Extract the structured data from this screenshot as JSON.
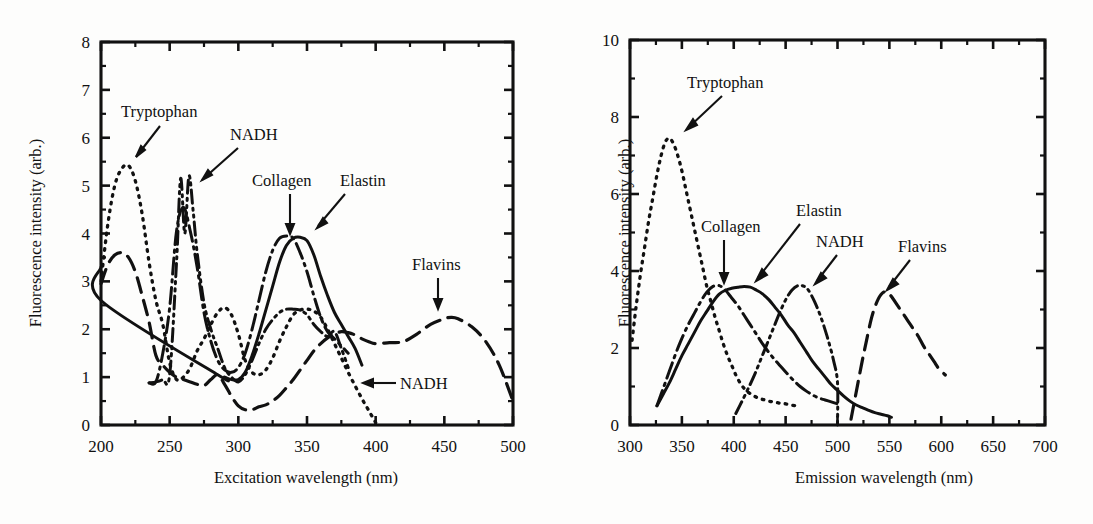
{
  "figure": {
    "kind": "two-panel-line-plot",
    "background": "#fdfdfc",
    "ink_color": "#111111"
  },
  "panels": {
    "left": {
      "ylabel": "Fluorescence intensity (arb.)",
      "xlabel": "Excitation wavelength (nm)",
      "xticks": [
        "200",
        "250",
        "300",
        "350",
        "400",
        "450",
        "500"
      ],
      "yticks": [
        "0",
        "1",
        "2",
        "3",
        "4",
        "5",
        "6",
        "7",
        "8"
      ],
      "annotations": [
        {
          "text": "Tryptophan"
        },
        {
          "text": "NADH"
        },
        {
          "text": "Collagen"
        },
        {
          "text": "Elastin"
        },
        {
          "text": "Flavins"
        },
        {
          "text": "NADH"
        }
      ]
    },
    "right": {
      "ylabel": "Fluorescence intensity (arb.)",
      "xlabel": "Emission wavelength (nm)",
      "xticks": [
        "300",
        "350",
        "400",
        "450",
        "500",
        "550",
        "600",
        "650",
        "700"
      ],
      "yticks": [
        "0",
        "2",
        "4",
        "6",
        "8",
        "10"
      ],
      "annotations": [
        {
          "text": "Tryptophan"
        },
        {
          "text": "Collagen"
        },
        {
          "text": "Elastin"
        },
        {
          "text": "NADH"
        },
        {
          "text": "Flavins"
        }
      ]
    }
  },
  "chart_data": [
    {
      "type": "line",
      "panel": "left",
      "title": "",
      "xlabel": "Excitation wavelength (nm)",
      "ylabel": "Fluorescence intensity (arb.)",
      "xlim": [
        200,
        500
      ],
      "ylim": [
        0,
        8
      ],
      "xticks": [
        200,
        250,
        300,
        350,
        400,
        450,
        500
      ],
      "yticks": [
        0,
        1,
        2,
        3,
        4,
        5,
        6,
        7,
        8
      ],
      "grid": false,
      "legend": "inline-annotations",
      "series": [
        {
          "name": "Tryptophan",
          "style": "dotted",
          "x": [
            200,
            205,
            210,
            215,
            220,
            225,
            230,
            235,
            240,
            245,
            250,
            255,
            260,
            265,
            270,
            275,
            280,
            285,
            290,
            295,
            300,
            305,
            310,
            315,
            320,
            325,
            330,
            335,
            340,
            345,
            350,
            355,
            360,
            365,
            370,
            375,
            380,
            385,
            390,
            395,
            400
          ],
          "y": [
            3.0,
            4.2,
            5.0,
            5.35,
            5.42,
            5.1,
            4.4,
            3.4,
            2.6,
            2.1,
            1.3,
            0.95,
            1.0,
            1.2,
            1.55,
            1.8,
            2.1,
            2.35,
            2.45,
            2.3,
            1.9,
            1.35,
            1.1,
            1.05,
            1.15,
            1.4,
            1.75,
            2.05,
            2.3,
            2.4,
            2.42,
            2.38,
            2.25,
            2.0,
            1.7,
            1.4,
            1.1,
            0.82,
            0.55,
            0.3,
            0.05
          ]
        },
        {
          "name": "NADH",
          "style": "dash-dot-dot",
          "x": [
            235,
            240,
            245,
            250,
            255,
            258,
            261,
            264,
            267,
            270,
            275,
            280,
            285,
            290,
            295,
            300,
            305,
            310,
            315,
            320,
            325,
            330,
            335,
            340,
            345,
            350,
            355,
            360,
            365,
            370,
            375,
            380
          ],
          "y": [
            0.88,
            0.9,
            0.95,
            1.05,
            3.4,
            5.15,
            4.0,
            5.2,
            4.5,
            3.6,
            2.55,
            2.0,
            1.6,
            1.2,
            1.0,
            0.9,
            1.05,
            1.35,
            1.7,
            2.0,
            2.2,
            2.35,
            2.42,
            2.42,
            2.4,
            2.3,
            2.1,
            1.95,
            1.85,
            1.95,
            1.6,
            1.2
          ]
        },
        {
          "name": "Collagen",
          "style": "dash-dot",
          "x": [
            235,
            240,
            245,
            250,
            255,
            260,
            265,
            270,
            275,
            280,
            285,
            290,
            295,
            300,
            305,
            310,
            315,
            320,
            325,
            330,
            335,
            340,
            345,
            350,
            355,
            360,
            365,
            370,
            375,
            380
          ],
          "y": [
            0.88,
            0.9,
            1.5,
            2.45,
            4.05,
            4.55,
            4.05,
            3.3,
            2.35,
            1.75,
            1.35,
            1.15,
            1.1,
            1.2,
            1.5,
            2.0,
            2.6,
            3.2,
            3.65,
            3.9,
            3.95,
            3.9,
            3.6,
            3.2,
            2.7,
            2.25,
            1.95,
            1.8,
            1.65,
            1.5
          ]
        },
        {
          "name": "Elastin",
          "style": "solid",
          "x": [
            200,
            200,
            285,
            290,
            295,
            300,
            305,
            310,
            315,
            320,
            325,
            330,
            335,
            340,
            345,
            350,
            355,
            360,
            365,
            370,
            375,
            380,
            385,
            390
          ],
          "y": [
            3.3,
            2.6,
            1.05,
            1.0,
            0.95,
            0.95,
            1.1,
            1.45,
            1.9,
            2.4,
            2.9,
            3.4,
            3.75,
            3.9,
            3.92,
            3.85,
            3.55,
            3.1,
            2.7,
            2.35,
            2.1,
            1.85,
            1.6,
            1.25
          ]
        },
        {
          "name": "Flavins",
          "style": "long-dash",
          "x": [
            200,
            205,
            210,
            215,
            220,
            225,
            230,
            235,
            240,
            245,
            250,
            255,
            260,
            265,
            270,
            275,
            280,
            285,
            290,
            295,
            300,
            305,
            310,
            315,
            320,
            325,
            330,
            335,
            340,
            345,
            350,
            355,
            360,
            365,
            370,
            375,
            380,
            385,
            390,
            395,
            400,
            410,
            420,
            430,
            440,
            450,
            455,
            460,
            470,
            480,
            490,
            500
          ],
          "y": [
            2.95,
            3.35,
            3.55,
            3.6,
            3.5,
            3.2,
            2.7,
            2.15,
            1.45,
            1.25,
            1.1,
            1.0,
            0.95,
            0.9,
            0.85,
            0.82,
            0.95,
            1.05,
            0.85,
            0.6,
            0.4,
            0.32,
            0.32,
            0.38,
            0.42,
            0.5,
            0.62,
            0.78,
            0.95,
            1.15,
            1.35,
            1.55,
            1.7,
            1.82,
            1.9,
            1.95,
            1.93,
            1.88,
            1.8,
            1.74,
            1.7,
            1.72,
            1.74,
            1.9,
            2.1,
            2.22,
            2.25,
            2.22,
            2.05,
            1.75,
            1.25,
            0.5
          ]
        }
      ]
    },
    {
      "type": "line",
      "panel": "right",
      "title": "",
      "xlabel": "Emission wavelength (nm)",
      "ylabel": "Fluorescence intensity (arb.)",
      "xlim": [
        300,
        700
      ],
      "ylim": [
        0,
        10
      ],
      "xticks": [
        300,
        350,
        400,
        450,
        500,
        550,
        600,
        650,
        700
      ],
      "yticks": [
        0,
        2,
        4,
        6,
        8,
        10
      ],
      "grid": false,
      "legend": "inline-annotations",
      "series": [
        {
          "name": "Tryptophan",
          "style": "dotted",
          "x": [
            302,
            306,
            310,
            314,
            318,
            322,
            326,
            330,
            334,
            338,
            342,
            346,
            350,
            354,
            358,
            362,
            366,
            370,
            374,
            378,
            382,
            386,
            390,
            394,
            398,
            402,
            406,
            410,
            414,
            418,
            422,
            426,
            430,
            434,
            438,
            442,
            446,
            450,
            455,
            460
          ],
          "y": [
            2.2,
            3.1,
            3.9,
            4.6,
            5.3,
            5.9,
            6.5,
            7.0,
            7.35,
            7.45,
            7.3,
            7.0,
            6.6,
            6.1,
            5.6,
            5.1,
            4.6,
            4.1,
            3.6,
            3.2,
            2.8,
            2.45,
            2.1,
            1.8,
            1.55,
            1.3,
            1.1,
            0.95,
            0.85,
            0.78,
            0.72,
            0.68,
            0.65,
            0.62,
            0.6,
            0.58,
            0.56,
            0.55,
            0.52,
            0.5
          ]
        },
        {
          "name": "Collagen",
          "style": "dash-dot",
          "x": [
            326,
            332,
            338,
            344,
            350,
            356,
            362,
            368,
            374,
            380,
            386,
            392,
            398,
            404,
            410,
            416,
            422,
            428,
            434,
            440,
            446,
            452,
            458,
            464,
            470,
            476,
            482,
            488,
            494,
            500
          ],
          "y": [
            0.5,
            0.95,
            1.4,
            1.85,
            2.25,
            2.6,
            2.9,
            3.2,
            3.45,
            3.6,
            3.62,
            3.5,
            3.3,
            3.1,
            2.85,
            2.6,
            2.35,
            2.1,
            1.88,
            1.68,
            1.5,
            1.32,
            1.15,
            1.0,
            0.88,
            0.78,
            0.7,
            0.65,
            0.6,
            0.55
          ]
        },
        {
          "name": "Elastin",
          "style": "solid",
          "x": [
            326,
            332,
            338,
            344,
            350,
            356,
            362,
            368,
            374,
            380,
            386,
            392,
            398,
            404,
            410,
            416,
            422,
            428,
            434,
            440,
            446,
            452,
            458,
            464,
            470,
            476,
            482,
            488,
            494,
            500,
            506,
            512,
            518,
            524,
            530,
            536,
            542,
            548,
            552
          ],
          "y": [
            0.5,
            0.8,
            1.1,
            1.45,
            1.8,
            2.1,
            2.4,
            2.7,
            2.95,
            3.2,
            3.4,
            3.5,
            3.55,
            3.58,
            3.6,
            3.58,
            3.5,
            3.4,
            3.25,
            3.05,
            2.85,
            2.6,
            2.4,
            2.15,
            1.9,
            1.65,
            1.45,
            1.25,
            1.05,
            0.9,
            0.75,
            0.62,
            0.52,
            0.45,
            0.38,
            0.32,
            0.28,
            0.24,
            0.2
          ]
        },
        {
          "name": "NADH",
          "style": "dash-dot-dot",
          "x": [
            402,
            408,
            414,
            420,
            426,
            432,
            438,
            444,
            450,
            456,
            462,
            468,
            472,
            478,
            484,
            490,
            496,
            500,
            500
          ],
          "y": [
            0.3,
            0.62,
            0.95,
            1.3,
            1.7,
            2.1,
            2.5,
            2.9,
            3.25,
            3.5,
            3.62,
            3.6,
            3.5,
            3.2,
            2.8,
            2.3,
            1.7,
            1.1,
            0.0
          ]
        },
        {
          "name": "Flavins",
          "style": "long-dash",
          "x": [
            513,
            518,
            523,
            528,
            533,
            538,
            543,
            548,
            553,
            558,
            563,
            568,
            573,
            578,
            583,
            588,
            593,
            598,
            604
          ],
          "y": [
            0.15,
            0.85,
            1.55,
            2.2,
            2.8,
            3.2,
            3.42,
            3.45,
            3.3,
            3.1,
            2.9,
            2.7,
            2.5,
            2.3,
            2.05,
            1.85,
            1.65,
            1.45,
            1.3
          ]
        }
      ]
    }
  ]
}
